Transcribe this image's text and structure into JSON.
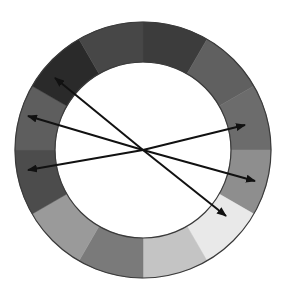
{
  "diagram": {
    "type": "color-wheel-grayscale",
    "center": [
      143,
      150
    ],
    "outer_radius": 128,
    "inner_radius": 88,
    "outline_color": "#3a3a3a",
    "segments": [
      {
        "index": 0,
        "start_deg": 0,
        "end_deg": 30,
        "color": "#3c3c3c"
      },
      {
        "index": 1,
        "start_deg": 30,
        "end_deg": 60,
        "color": "#606060"
      },
      {
        "index": 2,
        "start_deg": 60,
        "end_deg": 90,
        "color": "#6c6c6c"
      },
      {
        "index": 3,
        "start_deg": 90,
        "end_deg": 120,
        "color": "#8e8e8e"
      },
      {
        "index": 4,
        "start_deg": 120,
        "end_deg": 150,
        "color": "#e9e9e9"
      },
      {
        "index": 5,
        "start_deg": 150,
        "end_deg": 180,
        "color": "#c4c4c4"
      },
      {
        "index": 6,
        "start_deg": 180,
        "end_deg": 210,
        "color": "#7a7a7a"
      },
      {
        "index": 7,
        "start_deg": 210,
        "end_deg": 240,
        "color": "#9a9a9a"
      },
      {
        "index": 8,
        "start_deg": 240,
        "end_deg": 270,
        "color": "#4c4c4c"
      },
      {
        "index": 9,
        "start_deg": 270,
        "end_deg": 300,
        "color": "#5e5e5e"
      },
      {
        "index": 10,
        "start_deg": 300,
        "end_deg": 330,
        "color": "#2a2a2a"
      },
      {
        "index": 11,
        "start_deg": 330,
        "end_deg": 360,
        "color": "#474747"
      }
    ],
    "arrows": [
      {
        "name": "arrow-upper-left",
        "from": [
          143,
          150
        ],
        "to": [
          55,
          78
        ]
      },
      {
        "name": "arrow-left-upper",
        "from": [
          143,
          150
        ],
        "to": [
          28,
          116
        ]
      },
      {
        "name": "arrow-left-lower",
        "from": [
          143,
          150
        ],
        "to": [
          28,
          170
        ]
      },
      {
        "name": "arrow-right-upper",
        "from": [
          143,
          150
        ],
        "to": [
          245,
          125
        ]
      },
      {
        "name": "arrow-right-lower",
        "from": [
          143,
          150
        ],
        "to": [
          255,
          181
        ]
      },
      {
        "name": "arrow-lower-right",
        "from": [
          143,
          150
        ],
        "to": [
          226,
          216
        ]
      }
    ],
    "arrow_color": "#111111"
  }
}
